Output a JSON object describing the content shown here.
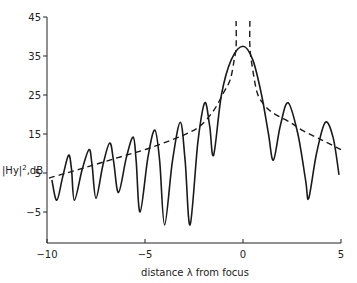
{
  "chart_data": {
    "type": "line",
    "title": "",
    "xlabel": "distance λ from focus",
    "ylabel": "|Hy|², dB",
    "xlim": [
      -10,
      5
    ],
    "ylim": [
      -13,
      45
    ],
    "grid": false,
    "legend": null,
    "x_ticks": [
      -10,
      -5,
      0,
      5
    ],
    "x_tick_labels": [
      "-10",
      "-5",
      "0",
      "5"
    ],
    "y_ticks": [
      45,
      35,
      25,
      15,
      5,
      -5
    ],
    "y_tick_labels": [
      "45",
      "35",
      "25",
      "15",
      "5",
      "-5"
    ],
    "series": [
      {
        "name": "exact (solid)",
        "style": "solid",
        "color": "#1a1a1a",
        "x": [
          -9.75,
          -9.5,
          -9.2,
          -8.9,
          -8.75,
          -8.6,
          -8.2,
          -7.85,
          -7.7,
          -7.5,
          -7.15,
          -6.8,
          -6.6,
          -6.35,
          -5.95,
          -5.6,
          -5.45,
          -5.25,
          -4.85,
          -4.5,
          -4.25,
          -4.0,
          -3.6,
          -3.2,
          -2.95,
          -2.7,
          -2.3,
          -1.95,
          -1.7,
          -1.5,
          -1.1,
          -0.6,
          0.0,
          0.5,
          0.95,
          1.3,
          1.55,
          1.9,
          2.3,
          2.8,
          3.2,
          3.35,
          3.75,
          4.2,
          4.6,
          4.9
        ],
        "y": [
          3.2,
          -2.0,
          4.0,
          9.6,
          6.0,
          -2.0,
          6.0,
          11.0,
          7.0,
          -1.5,
          7.0,
          12.7,
          8.0,
          0.0,
          9.0,
          14.2,
          8.0,
          -5.0,
          9.0,
          16.0,
          8.0,
          -8.3,
          8.0,
          18.0,
          8.0,
          -8.3,
          13.0,
          23.0,
          17.0,
          9.6,
          25.0,
          34.0,
          37.5,
          34.0,
          25.0,
          15.0,
          8.3,
          17.0,
          23.0,
          15.0,
          3.0,
          -1.5,
          10.0,
          18.0,
          14.0,
          4.5
        ]
      },
      {
        "name": "approximation (dashed)",
        "style": "dashed",
        "color": "#1a1a1a",
        "x": [
          -9.9,
          -9.0,
          -8.0,
          -7.0,
          -6.0,
          -5.0,
          -4.0,
          -3.0,
          -2.2,
          -1.5,
          -1.0,
          -0.65,
          -0.45,
          -0.35,
          -0.35,
          0.35,
          0.35,
          0.45,
          0.7,
          1.0,
          1.5,
          2.4,
          3.0,
          4.0,
          5.0
        ],
        "y": [
          3.7,
          5.0,
          6.5,
          8.0,
          9.5,
          11.0,
          12.8,
          14.8,
          17.0,
          21.0,
          25.5,
          29.0,
          34.0,
          37.5,
          44.0,
          44.0,
          37.5,
          33.0,
          26.0,
          23.0,
          20.5,
          18.0,
          16.0,
          13.5,
          11.0
        ]
      }
    ]
  }
}
